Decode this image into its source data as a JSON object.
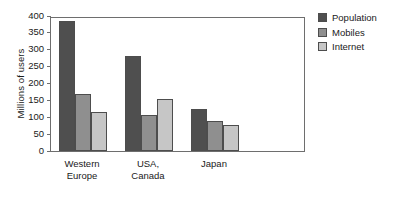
{
  "chart_data": {
    "type": "bar",
    "title": "",
    "xlabel": "",
    "ylabel": "Millions of users",
    "categories": [
      "Western Europe",
      "USA, Canada",
      "Japan"
    ],
    "category_lines": [
      [
        "Western",
        "Europe"
      ],
      [
        "USA,",
        "Canada"
      ],
      [
        "Japan",
        ""
      ]
    ],
    "series": [
      {
        "name": "Population",
        "color": "#4f4f4f",
        "values": [
          385,
          283,
          125
        ]
      },
      {
        "name": "Mobiles",
        "color": "#8f8f8f",
        "values": [
          170,
          107,
          90
        ]
      },
      {
        "name": "Internet",
        "color": "#c6c6c6",
        "values": [
          115,
          153,
          77
        ]
      }
    ],
    "ylim": [
      0,
      400
    ],
    "yticks": [
      0,
      50,
      100,
      150,
      200,
      250,
      300,
      350,
      400
    ],
    "ytick_labels": [
      "0",
      "50",
      "100",
      "150",
      "200",
      "250",
      "300",
      "350",
      "400"
    ],
    "grid": false,
    "legend_position": "right-outside",
    "legend_entries": [
      "Population",
      "Mobiles",
      "Internet"
    ],
    "bar_edge_color": "#4d4d4d",
    "axis_color": "#6e6e6e",
    "background_color": "#ffffff"
  }
}
